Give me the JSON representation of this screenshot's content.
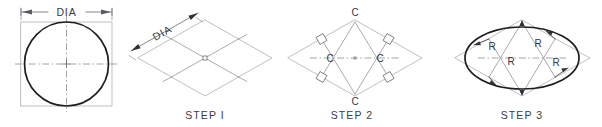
{
  "figure": {
    "background_color": "#ffffff",
    "object_line_color": "#27272a",
    "construction_line_color": "#b4b4ba",
    "text_color": "#3a3a40",
    "width": 602,
    "height": 127
  },
  "panels": [
    {
      "id": "panel-circle",
      "step_label": "",
      "dimension_label": "DIA",
      "description": "True circle inscribed in a square with centerlines and DIA dimension"
    },
    {
      "id": "panel-step-1",
      "step_label": "STEP I",
      "dimension_label": "DIA",
      "description": "Isometric rhombus of side DIA with center lines dividing it into four rhombi"
    },
    {
      "id": "panel-step-2",
      "step_label": "STEP 2",
      "center_labels": [
        "C",
        "C",
        "C",
        "C"
      ],
      "description": "Perpendicular bisectors drawn from obtuse corners locating four centers C"
    },
    {
      "id": "panel-step-3",
      "step_label": "STEP 3",
      "radius_labels": [
        "R",
        "R",
        "R",
        "R"
      ],
      "description": "Four arcs of radius R joined to form the approximate isometric ellipse"
    }
  ],
  "labels": {
    "dia": "DIA",
    "center": "C",
    "radius": "R",
    "step1": "STEP I",
    "step2": "STEP 2",
    "step3": "STEP 3"
  }
}
